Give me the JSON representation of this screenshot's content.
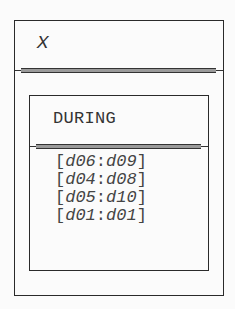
{
  "outer_class": {
    "name": "X",
    "name_style": "italic"
  },
  "inner_class": {
    "name": "DURING",
    "ranges": [
      {
        "open": "[",
        "start": "d06",
        "sep": ":",
        "end": "d09",
        "close": "]"
      },
      {
        "open": "[",
        "start": "d04",
        "sep": ":",
        "end": "d08",
        "close": "]"
      },
      {
        "open": "[",
        "start": "d05",
        "sep": ":",
        "end": "d10",
        "close": "]"
      },
      {
        "open": "[",
        "start": "d01",
        "sep": ":",
        "end": "d01",
        "close": "]"
      }
    ]
  },
  "colors": {
    "border": "#2a2a2a",
    "text": "#333333",
    "separator_fill": "#9a9a9a",
    "background": "#fbfbfb"
  }
}
